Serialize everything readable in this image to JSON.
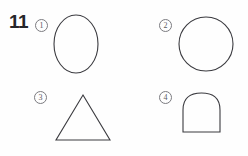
{
  "worksheet": {
    "problem_number": "11",
    "background_color": "#fefefe",
    "stroke_color": "#3a3a3f",
    "marker_color": "#5a5a5f"
  },
  "options": [
    {
      "marker": "①",
      "marker_number": "1",
      "shape_name": "ellipse",
      "icon": "ellipse-icon"
    },
    {
      "marker": "②",
      "marker_number": "2",
      "shape_name": "circle",
      "icon": "circle-icon"
    },
    {
      "marker": "③",
      "marker_number": "3",
      "shape_name": "triangle",
      "icon": "triangle-icon"
    },
    {
      "marker": "④",
      "marker_number": "4",
      "shape_name": "dome",
      "icon": "dome-icon"
    }
  ],
  "figure_data": {
    "type": "diagram",
    "shapes": [
      {
        "id": "ellipse",
        "cx": 24,
        "cy": 30,
        "rx": 22,
        "ry": 29
      },
      {
        "id": "circle",
        "cx": 28,
        "cy": 28,
        "r": 27
      },
      {
        "id": "triangle",
        "points": "31,5 58,50 4,50"
      },
      {
        "id": "dome",
        "base_left_x": 5,
        "base_right_x": 42,
        "base_y": 44,
        "apex_x": 23,
        "apex_y": 5,
        "side_top_y": 22
      }
    ]
  }
}
